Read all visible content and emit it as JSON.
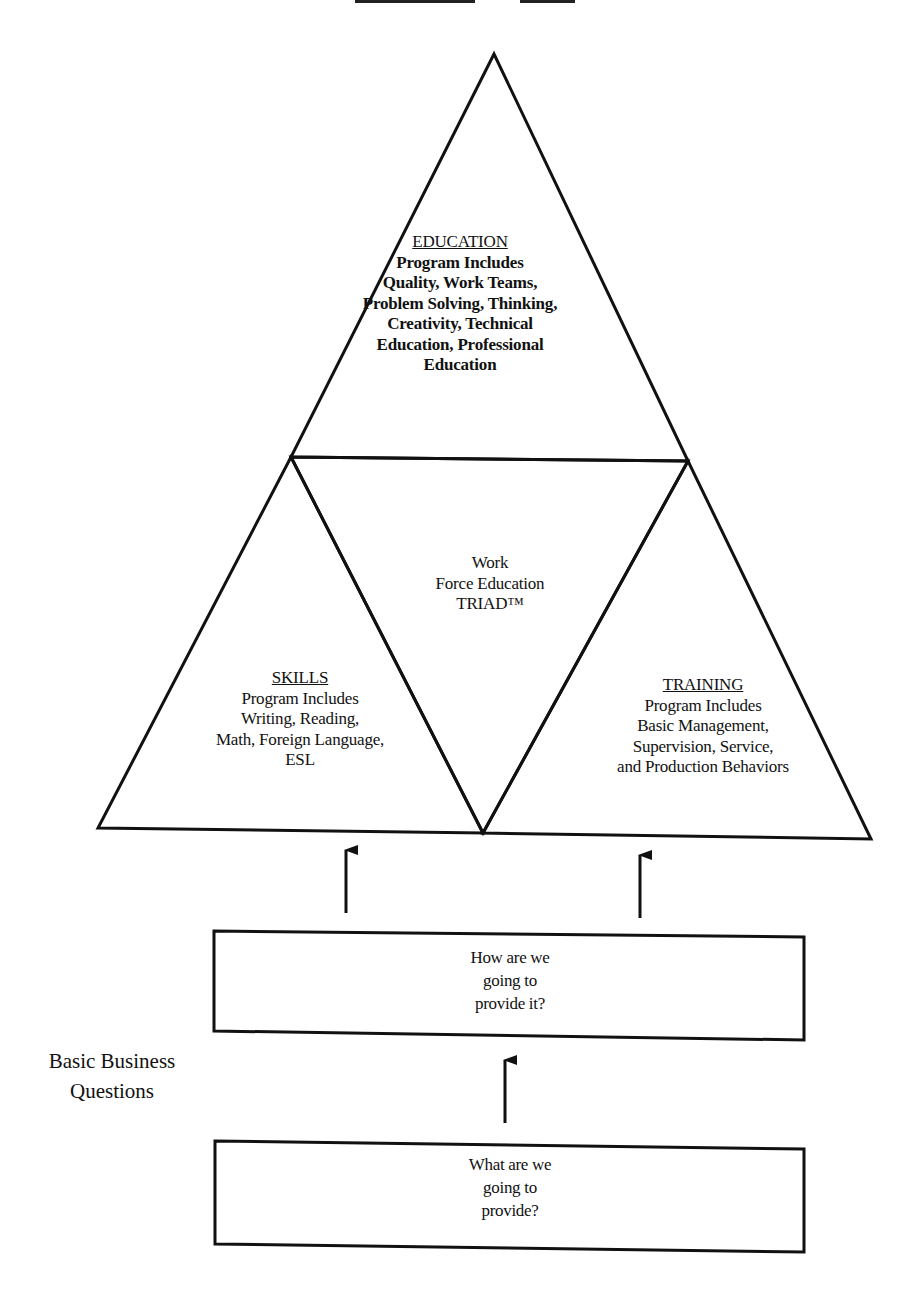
{
  "diagram": {
    "title_fragment": "Work Force Education TRIAD",
    "education": {
      "heading": "EDUCATION",
      "lines": [
        "Program Includes",
        "Quality, Work Teams,",
        "Problem Solving, Thinking,",
        "Creativity, Technical",
        "Education, Professional",
        "Education"
      ]
    },
    "center": {
      "lines": [
        "Work",
        "Force Education",
        "TRIAD™"
      ]
    },
    "skills": {
      "heading": "SKILLS",
      "lines": [
        "Program Includes",
        "Writing, Reading,",
        "Math, Foreign Language,",
        "ESL"
      ]
    },
    "training": {
      "heading": "TRAINING",
      "lines": [
        "Program Includes",
        "Basic Management,",
        "Supervision, Service,",
        "and Production Behaviors"
      ]
    },
    "side_label": {
      "lines": [
        "Basic Business",
        "Questions"
      ]
    },
    "box_how": {
      "lines": [
        "How are we",
        "going to",
        "provide it?"
      ]
    },
    "box_what": {
      "lines": [
        "What are we",
        "going to",
        "provide?"
      ]
    },
    "colors": {
      "stroke": "#111111",
      "background": "#ffffff"
    }
  }
}
